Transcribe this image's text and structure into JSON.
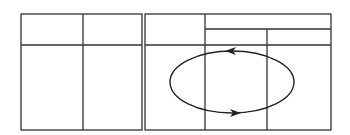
{
  "diagram": {
    "stroke_color": "#333333",
    "background": "#ffffff",
    "left_table": {
      "rows": 2,
      "cols": 2,
      "cells": [
        [
          "",
          ""
        ],
        [
          "",
          ""
        ]
      ]
    },
    "right_table": {
      "header": {
        "top_left": "",
        "top_right_span": "",
        "sub_left": "",
        "sub_right": ""
      },
      "body_cells": [
        "",
        "",
        ""
      ]
    },
    "cycle": {
      "shape": "ellipse",
      "top_arrow_direction": "left",
      "bottom_arrow_direction": "right"
    }
  }
}
